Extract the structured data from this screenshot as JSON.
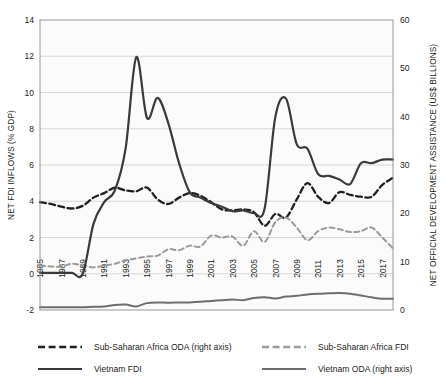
{
  "chart_data": {
    "type": "line",
    "title": "",
    "subtitle": "",
    "xlabel": "",
    "ylabel": "NET FDI INFLOWS (% GDP)",
    "y2label": "NET OFFICIAL DEVELOPMENT ASSISTANCE (US$ BILLIONS)",
    "ylim": [
      -2,
      14
    ],
    "y2lim": [
      0,
      60
    ],
    "yticks": [
      "14",
      "12",
      "10",
      "8",
      "6",
      "4",
      "2",
      "0",
      "-2"
    ],
    "y2ticks": [
      "60",
      "50",
      "40",
      "30",
      "20",
      "10",
      "0"
    ],
    "grid": true,
    "legend_position": "bottom",
    "x": [
      1985,
      1986,
      1987,
      1988,
      1989,
      1990,
      1991,
      1992,
      1993,
      1994,
      1995,
      1996,
      1997,
      1998,
      1999,
      2000,
      2001,
      2002,
      2003,
      2004,
      2005,
      2006,
      2007,
      2008,
      2009,
      2010,
      2011,
      2012,
      2013,
      2014,
      2015,
      2016,
      2017,
      2018
    ],
    "xtick_labels": [
      "1985",
      "1987",
      "1989",
      "1991",
      "1993",
      "1995",
      "1997",
      "1999",
      "2001",
      "2003",
      "2005",
      "2007",
      "2009",
      "2011",
      "2013",
      "2015",
      "2017"
    ],
    "series": [
      {
        "name": "Sub-Saharan Africa ODA (right axis)",
        "axis": "right",
        "style": "dashed",
        "color": "#231f20",
        "width": 2.3,
        "values_left_scale": [
          3.95,
          3.85,
          3.7,
          3.6,
          3.75,
          4.2,
          4.45,
          4.75,
          4.6,
          4.55,
          4.75,
          4.1,
          3.85,
          4.2,
          4.45,
          4.3,
          3.95,
          3.55,
          3.5,
          3.55,
          3.4,
          2.65,
          3.3,
          3.1,
          4.1,
          5.0,
          4.25,
          3.9,
          4.5,
          4.35,
          4.25,
          4.25,
          4.9,
          5.3
        ],
        "values": [
          22.0,
          21.6,
          21.0,
          20.6,
          21.2,
          23.0,
          24.0,
          25.2,
          24.6,
          24.4,
          25.2,
          23.0,
          22.0,
          23.4,
          24.4,
          23.7,
          22.2,
          20.8,
          20.6,
          20.8,
          20.2,
          17.4,
          20.0,
          19.1,
          23.0,
          26.2,
          23.5,
          22.1,
          24.4,
          23.8,
          23.4,
          23.4,
          25.9,
          27.4
        ]
      },
      {
        "name": "Sub-Saharan Africa FDI",
        "axis": "left",
        "style": "dashed",
        "color": "#9b9b9b",
        "width": 2.0,
        "values": [
          0.45,
          0.4,
          0.4,
          0.55,
          0.45,
          0.35,
          0.45,
          0.55,
          0.75,
          0.85,
          0.95,
          1.0,
          1.35,
          1.3,
          1.55,
          1.5,
          2.1,
          2.0,
          2.05,
          1.55,
          2.35,
          1.75,
          2.85,
          3.1,
          2.55,
          1.85,
          2.35,
          2.55,
          2.45,
          2.3,
          2.35,
          2.55,
          2.0,
          1.4
        ]
      },
      {
        "name": "Vietnam FDI",
        "axis": "left",
        "style": "solid",
        "color": "#3a3a3a",
        "width": 2.2,
        "values": [
          0.05,
          0.05,
          0.05,
          0.05,
          0.0,
          2.75,
          3.95,
          4.6,
          6.9,
          11.95,
          8.6,
          9.7,
          8.3,
          6.1,
          4.5,
          4.2,
          3.9,
          3.7,
          3.45,
          3.5,
          3.35,
          3.6,
          8.65,
          9.66,
          7.15,
          6.9,
          5.5,
          5.4,
          5.2,
          4.95,
          6.1,
          6.1,
          6.3,
          6.3
        ]
      },
      {
        "name": "Vietnam ODA (right axis)",
        "axis": "right",
        "style": "solid",
        "color": "#6d6d6d",
        "width": 2.0,
        "values_left_scale": [
          -1.85,
          -1.85,
          -1.85,
          -1.85,
          -1.85,
          -1.82,
          -1.8,
          -1.72,
          -1.7,
          -1.8,
          -1.62,
          -1.58,
          -1.6,
          -1.58,
          -1.58,
          -1.55,
          -1.5,
          -1.46,
          -1.42,
          -1.46,
          -1.34,
          -1.3,
          -1.36,
          -1.26,
          -1.22,
          -1.14,
          -1.1,
          -1.08,
          -1.06,
          -1.1,
          -1.2,
          -1.3,
          -1.38,
          -1.38
        ],
        "values": [
          0.55,
          0.55,
          0.55,
          0.55,
          0.55,
          0.68,
          0.75,
          1.05,
          1.12,
          0.75,
          1.42,
          1.58,
          1.5,
          1.58,
          1.58,
          1.69,
          1.88,
          2.03,
          2.18,
          2.03,
          2.48,
          2.62,
          2.4,
          2.78,
          2.92,
          3.22,
          3.38,
          3.45,
          3.53,
          3.38,
          3.0,
          2.62,
          2.32,
          2.32
        ]
      }
    ]
  },
  "legend": {
    "items": [
      {
        "label": "Sub-Saharan Africa ODA (right axis)",
        "style": "dashed",
        "color": "#231f20"
      },
      {
        "label": "Sub-Saharan Africa FDI",
        "style": "dashed",
        "color": "#9b9b9b"
      },
      {
        "label": "Vietnam FDI",
        "style": "solid",
        "color": "#3a3a3a"
      },
      {
        "label": "Vietnam ODA (right axis)",
        "style": "solid",
        "color": "#6d6d6d"
      }
    ]
  }
}
